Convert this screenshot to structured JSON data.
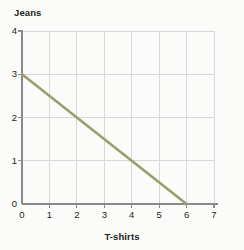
{
  "chart_data": {
    "type": "line",
    "title": "",
    "xlabel": "T-shirts",
    "ylabel": "Jeans",
    "xlim": [
      0,
      7
    ],
    "ylim": [
      0,
      4
    ],
    "xticks": [
      0,
      1,
      2,
      3,
      4,
      5,
      6,
      7
    ],
    "yticks": [
      0,
      1,
      2,
      3,
      4
    ],
    "xtick_labels": [
      "0",
      "1",
      "2",
      "3",
      "4",
      "5",
      "6",
      "7"
    ],
    "ytick_labels": [
      "0",
      "1",
      "2",
      "3",
      "4"
    ],
    "grid": true,
    "legend": false,
    "series": [
      {
        "name": "budget-constraint",
        "color": "#9a9e6e",
        "x": [
          0,
          6
        ],
        "y": [
          3,
          0
        ],
        "points": [
          {
            "x": 0,
            "y": 3
          },
          {
            "x": 2,
            "y": 2
          },
          {
            "x": 4,
            "y": 1
          },
          {
            "x": 6,
            "y": 0
          }
        ]
      }
    ]
  },
  "labels": {
    "y_axis_title": "Jeans",
    "x_axis_title": "T-shirts"
  },
  "colors": {
    "line": "#9a9e6e",
    "grid": "#d8d8d8",
    "axis": "#8a8a8a",
    "text": "#231f20",
    "background": "#fbfbf9"
  }
}
